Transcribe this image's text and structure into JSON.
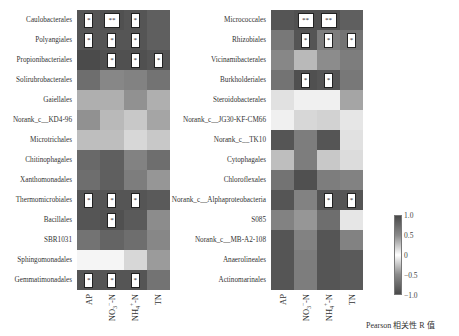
{
  "chart_data": [
    {
      "type": "heatmap",
      "title": "",
      "xlabel": "",
      "ylabel": "",
      "x": [
        "AP",
        "NO3--N",
        "NH4+-N",
        "TN"
      ],
      "rows": [
        "Caulobacterales",
        "Polyangiales",
        "Propionibacteriales",
        "Solirubrobacterales",
        "Gaiellales",
        "Norank_c__KD4-96",
        "Microtrichales",
        "Chitinophagales",
        "Xanthomonadales",
        "Thermomicrobiales",
        "Bacillales",
        "SBR1031",
        "Sphingomonadales",
        "Gemmatimonadales"
      ],
      "gray": [
        [
          85,
          80,
          85,
          95
        ],
        [
          85,
          85,
          85,
          95
        ],
        [
          75,
          80,
          80,
          85
        ],
        [
          110,
          135,
          130,
          115
        ],
        [
          175,
          175,
          145,
          175
        ],
        [
          145,
          185,
          200,
          165
        ],
        [
          190,
          190,
          215,
          200
        ],
        [
          105,
          95,
          130,
          110
        ],
        [
          110,
          95,
          125,
          150
        ],
        [
          85,
          85,
          85,
          90
        ],
        [
          85,
          80,
          90,
          140
        ],
        [
          115,
          100,
          110,
          135
        ],
        [
          245,
          245,
          215,
          155
        ],
        [
          85,
          85,
          85,
          115
        ]
      ],
      "significance": [
        [
          "*",
          "**",
          "*",
          ""
        ],
        [
          "*",
          "*",
          "*",
          ""
        ],
        [
          "",
          "*",
          "*",
          "*"
        ],
        [
          "",
          "",
          "",
          ""
        ],
        [
          "",
          "",
          "",
          ""
        ],
        [
          "",
          "",
          "",
          ""
        ],
        [
          "",
          "",
          "",
          ""
        ],
        [
          "",
          "",
          "",
          ""
        ],
        [
          "",
          "",
          "",
          ""
        ],
        [
          "*",
          "*",
          "*",
          ""
        ],
        [
          "",
          "*",
          "",
          ""
        ],
        [
          "",
          "",
          "",
          ""
        ],
        [
          "",
          "",
          "",
          ""
        ],
        [
          "*",
          "*",
          "*",
          ""
        ]
      ]
    },
    {
      "type": "heatmap",
      "title": "",
      "xlabel": "",
      "ylabel": "",
      "x": [
        "AP",
        "NO3--N",
        "NH4+-N",
        "TN"
      ],
      "rows": [
        "Micrococcales",
        "Rhizobiales",
        "Vicinamibacterales",
        "Burkholderiales",
        "Steroidobacterales",
        "Norank_c__JG30-KF-CM66",
        "Norank_c__TK10",
        "Cytophagales",
        "Chloroflexales",
        "Norank_c__Alphaproteobacteria",
        "S085",
        "Norank_c__MB-A2-108",
        "Anaerolineales",
        "Actinomarinales"
      ],
      "gray": [
        [
          85,
          80,
          80,
          95
        ],
        [
          120,
          85,
          125,
          115
        ],
        [
          135,
          185,
          140,
          125
        ],
        [
          115,
          80,
          85,
          120
        ],
        [
          225,
          240,
          240,
          165
        ],
        [
          240,
          215,
          210,
          230
        ],
        [
          85,
          125,
          85,
          225
        ],
        [
          190,
          125,
          200,
          220
        ],
        [
          115,
          80,
          125,
          130
        ],
        [
          85,
          130,
          85,
          85
        ],
        [
          130,
          150,
          110,
          230
        ],
        [
          85,
          130,
          85,
          130
        ],
        [
          85,
          125,
          85,
          90
        ],
        [
          85,
          125,
          85,
          90
        ]
      ],
      "significance": [
        [
          "",
          "**",
          "**",
          ""
        ],
        [
          "",
          "*",
          "*",
          "*"
        ],
        [
          "",
          "",
          "",
          ""
        ],
        [
          "",
          "*",
          "*",
          ""
        ],
        [
          "",
          "",
          "",
          ""
        ],
        [
          "",
          "",
          "",
          ""
        ],
        [
          "",
          "",
          "",
          ""
        ],
        [
          "",
          "",
          "",
          ""
        ],
        [
          "",
          "",
          "",
          ""
        ],
        [
          "",
          "",
          "*",
          "*"
        ],
        [
          "",
          "",
          "",
          ""
        ],
        [
          "",
          "",
          "",
          ""
        ],
        [
          "",
          "",
          "",
          ""
        ],
        [
          "",
          "",
          "",
          ""
        ]
      ]
    }
  ],
  "xaxis": {
    "labels": [
      {
        "base": "AP",
        "sub": "",
        "sup": "",
        "tail": ""
      },
      {
        "base": "NO",
        "sub": "3",
        "sup": "−",
        "tail": "-N"
      },
      {
        "base": "NH",
        "sub": "4",
        "sup": "+",
        "tail": "-N"
      },
      {
        "base": "TN",
        "sub": "",
        "sup": "",
        "tail": ""
      }
    ]
  },
  "colorbar": {
    "ticks": [
      "1.0",
      "0.5",
      "0",
      "−0.5",
      "−1.0"
    ],
    "title": "Pearson 相关性 R 值"
  }
}
